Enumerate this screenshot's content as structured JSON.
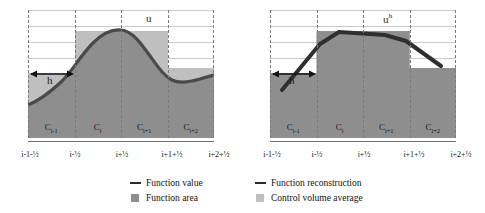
{
  "figure": {
    "type": "diagram"
  },
  "panels": [
    {
      "id": "left",
      "curve_label": "u",
      "curve_label_sup": "",
      "span_label": "h",
      "cells": [
        "C",
        "C",
        "C",
        "C"
      ],
      "cell_labels": [
        "Cᵢ₋₁",
        "Cᵢ",
        "Cᵢ₊₁",
        "Cᵢ₊₂"
      ],
      "cell_base": [
        "C",
        "C",
        "C",
        "C"
      ],
      "cell_sub": [
        "i-1",
        "i",
        "i+1",
        "i+2"
      ],
      "ticks": [
        "i-1-½",
        "i-½",
        "i+½",
        "i+1+½",
        "i+2+½"
      ],
      "cv_levels": [
        0.44,
        0.78,
        0.78,
        0.5
      ],
      "curve_points": [
        0.25,
        0.34,
        0.47,
        0.64,
        0.8,
        0.9,
        0.93,
        0.88,
        0.74,
        0.6,
        0.52,
        0.5,
        0.52,
        0.55
      ]
    },
    {
      "id": "right",
      "curve_label": "u",
      "curve_label_sup": "h",
      "span_label": "h",
      "cell_labels": [
        "Cᵢ₋₁",
        "Cᵢ",
        "Cᵢ₊₁",
        "Cᵢ₊₂"
      ],
      "cell_base": [
        "C",
        "C",
        "C",
        "C"
      ],
      "cell_sub": [
        "i-1",
        "i",
        "i+1",
        "i+2"
      ],
      "ticks": [
        "i-1-½",
        "i-½",
        "i+½",
        "i+1+½",
        "i+2+½"
      ],
      "cv_levels": [
        0.44,
        0.78,
        0.78,
        0.5
      ],
      "recon_points": [
        {
          "x": 0.06,
          "y": 0.4
        },
        {
          "x": 0.27,
          "y": 0.73
        },
        {
          "x": 0.36,
          "y": 0.82
        },
        {
          "x": 0.62,
          "y": 0.79
        },
        {
          "x": 0.73,
          "y": 0.75
        },
        {
          "x": 0.92,
          "y": 0.56
        }
      ]
    }
  ],
  "grid": {
    "horizontal_lines": 9,
    "vertical_dashed_positions": [
      0.0,
      0.25,
      0.5,
      0.75,
      1.0
    ]
  },
  "legend": {
    "items": [
      {
        "label": "Function value",
        "mark": "line",
        "color": "#2b2b2b"
      },
      {
        "label": "Function area",
        "mark": "swatch",
        "color": "#8e8e8e"
      },
      {
        "label": "Function reconstruction",
        "mark": "line",
        "color": "#2b2b2b"
      },
      {
        "label": "Control volume average",
        "mark": "swatch",
        "color": "#bfbfbf"
      }
    ]
  },
  "colors": {
    "function_area": "#8e8e8e",
    "control_volume_average": "#bfbfbf",
    "curve": "#4a4a4a",
    "reconstruction": "#2f2f2f",
    "gridline": "#c9c9c9",
    "dashed": "#7a7a7a",
    "baseline": "#6e6e6e"
  }
}
